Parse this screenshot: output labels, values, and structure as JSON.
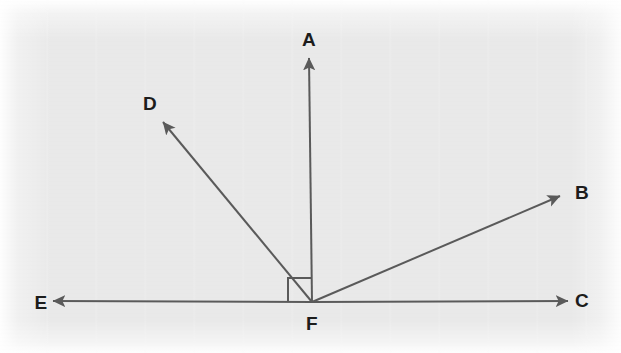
{
  "figure": {
    "kind": "geometry-diagram",
    "width": 621,
    "height": 353,
    "background_color": "#e9e9e9",
    "stroke_color": "#5a5a5a",
    "label_color": "#1c1c1c",
    "stroke_width": 2
  },
  "vertex": {
    "name": "F",
    "label": "F",
    "x": 312,
    "y": 302,
    "label_x": 312,
    "label_y": 323
  },
  "rays": [
    {
      "name": "ray-FA",
      "label": "A",
      "from_x": 312,
      "from_y": 302,
      "to_x": 309,
      "to_y": 58,
      "label_x": 309,
      "label_y": 39,
      "direction": "up",
      "angle_degrees": 90
    },
    {
      "name": "ray-FB",
      "label": "B",
      "from_x": 312,
      "from_y": 302,
      "to_x": 560,
      "to_y": 196,
      "label_x": 582,
      "label_y": 192,
      "direction": "up-right",
      "angle_degrees": 23
    },
    {
      "name": "ray-FC",
      "label": "C",
      "from_x": 312,
      "from_y": 302,
      "to_x": 568,
      "to_y": 301,
      "label_x": 582,
      "label_y": 300,
      "direction": "right",
      "angle_degrees": 0
    },
    {
      "name": "ray-FD",
      "label": "D",
      "from_x": 312,
      "from_y": 302,
      "to_x": 163,
      "to_y": 122,
      "label_x": 150,
      "label_y": 103,
      "direction": "up-left",
      "angle_degrees": 130
    },
    {
      "name": "ray-FE",
      "label": "E",
      "from_x": 312,
      "from_y": 302,
      "to_x": 53,
      "to_y": 301,
      "label_x": 41,
      "label_y": 302,
      "direction": "left",
      "angle_degrees": 180
    }
  ],
  "right_angle_marker": {
    "name": "right-angle-AFE",
    "between_rays": [
      "ray-FE",
      "ray-FA"
    ],
    "corner_x": 312,
    "corner_y": 302,
    "size": 24,
    "measure_degrees": 90
  }
}
